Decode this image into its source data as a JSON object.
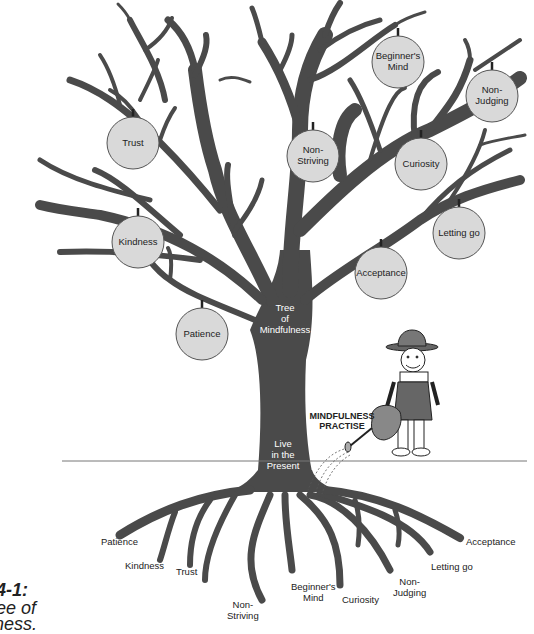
{
  "figure": {
    "title": "Tree of Mindfulness",
    "colors": {
      "tree": "#4a4a4a",
      "ball_fill": "#d9d9d9",
      "ball_stroke": "#555555",
      "ground_line": "#777777",
      "text": "#222222"
    }
  },
  "caption": {
    "line1": "4-1:",
    "line2": "ee of",
    "line3": "ness."
  },
  "trunk": {
    "label_top": "Tree\nof\nMindfulness",
    "label_bottom": "Live\nin the\nPresent"
  },
  "practise": {
    "label": "MINDFULNESS\nPRACTISE"
  },
  "ornaments": [
    {
      "label": "Trust",
      "cx": 133,
      "cy": 143
    },
    {
      "label": "Kindness",
      "cx": 138,
      "cy": 242
    },
    {
      "label": "Patience",
      "cx": 202,
      "cy": 334
    },
    {
      "label": "Non-\nStriving",
      "cx": 313,
      "cy": 156
    },
    {
      "label": "Beginner's\nMind",
      "cx": 398,
      "cy": 62
    },
    {
      "label": "Non-\nJudging",
      "cx": 492,
      "cy": 96
    },
    {
      "label": "Curiosity",
      "cx": 421,
      "cy": 164
    },
    {
      "label": "Letting go",
      "cx": 459,
      "cy": 233
    },
    {
      "label": "Acceptance",
      "cx": 381,
      "cy": 273
    }
  ],
  "roots": [
    {
      "label": "Patience",
      "x": 101,
      "y": 537
    },
    {
      "label": "Kindness",
      "x": 125,
      "y": 561
    },
    {
      "label": "Trust",
      "x": 176,
      "y": 567
    },
    {
      "label": "Non-\nStriving",
      "x": 227,
      "y": 600
    },
    {
      "label": "Beginner's\nMind",
      "x": 291,
      "y": 582
    },
    {
      "label": "Curiosity",
      "x": 342,
      "y": 595
    },
    {
      "label": "Non-\nJudging",
      "x": 393,
      "y": 577
    },
    {
      "label": "Letting go",
      "x": 431,
      "y": 562
    },
    {
      "label": "Acceptance",
      "x": 466,
      "y": 537
    }
  ]
}
